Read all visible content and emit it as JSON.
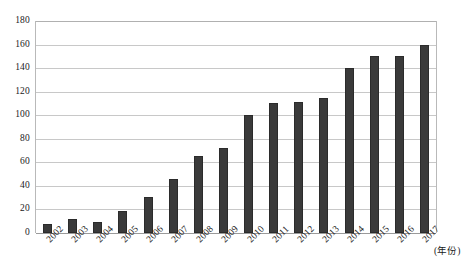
{
  "chart_data": {
    "type": "bar",
    "title": "",
    "xlabel": "(年份)",
    "ylabel": "",
    "categories": [
      "2002",
      "2003",
      "2004",
      "2005",
      "2006",
      "2007",
      "2008",
      "2009",
      "2010",
      "2011",
      "2012",
      "2013",
      "2014",
      "2015",
      "2016",
      "2017"
    ],
    "values": [
      8,
      12,
      9,
      19,
      31,
      46,
      65,
      72,
      100,
      110,
      111,
      115,
      140,
      150,
      150,
      160
    ],
    "ylim": [
      0,
      180
    ],
    "yticks": [
      0,
      20,
      40,
      60,
      80,
      100,
      120,
      140,
      160,
      180
    ],
    "ytick_labels": [
      "0",
      "20",
      "40",
      "60",
      "80",
      "100",
      "120",
      "140",
      "160",
      "180"
    ],
    "grid": true,
    "legend": null,
    "series": [
      {
        "name": "",
        "values": [
          8,
          12,
          9,
          19,
          31,
          46,
          65,
          72,
          100,
          110,
          111,
          115,
          140,
          150,
          150,
          160
        ]
      }
    ],
    "colors": {
      "bar": "#3a3a3a",
      "gridline": "#c8c8c8",
      "border": "#b9b9b9",
      "background": "#ffffff",
      "text": "#1a1a1a"
    }
  }
}
